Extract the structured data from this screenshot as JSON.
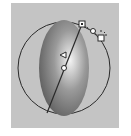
{
  "figure": {
    "colors": {
      "background": "#ffffff",
      "panel": "#c4c4c4",
      "gradient_center": "#f2f2f2",
      "gradient_mid": "#8a8a8a",
      "gradient_edge": "#5a5a5a",
      "outline": "#2a2a2a"
    },
    "handles": [
      {
        "name": "origin-handle",
        "shape": "circle"
      },
      {
        "name": "focus-handle",
        "shape": "triangle"
      },
      {
        "name": "radius-handle",
        "shape": "square"
      },
      {
        "name": "rotation-handle",
        "shape": "circle"
      },
      {
        "name": "scale-handle",
        "shape": "square"
      }
    ]
  }
}
